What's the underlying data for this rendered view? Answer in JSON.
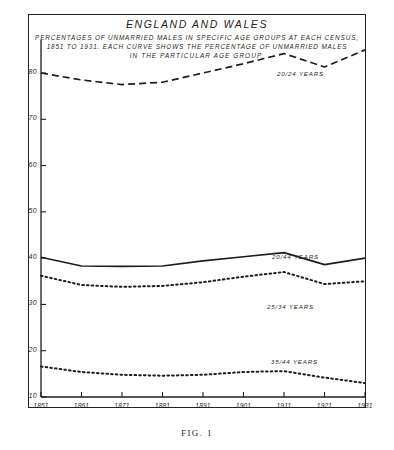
{
  "figure": {
    "caption": "FIG. 1",
    "title": "ENGLAND AND WALES",
    "subtitle_lines": [
      "PERCENTAGES OF UNMARRIED MALES IN SPECIFIC AGE GROUPS AT EACH CENSUS,",
      "1851 TO 1931. EACH CURVE SHOWS THE PERCENTAGE OF UNMARRIED MALES",
      "IN THE  PARTICULAR  AGE  GROUP."
    ]
  },
  "chart_data": {
    "type": "line",
    "title": "ENGLAND AND WALES",
    "subtitle": "PERCENTAGES OF UNMARRIED MALES IN SPECIFIC AGE GROUPS AT EACH CENSUS, 1851 TO 1931. EACH CURVE SHOWS THE PERCENTAGE OF UNMARRIED MALES IN THE PARTICULAR AGE GROUP.",
    "xlabel": "",
    "ylabel": "",
    "x": [
      1851,
      1861,
      1871,
      1881,
      1891,
      1901,
      1911,
      1921,
      1931
    ],
    "xtick_labels": [
      "1851",
      "1861",
      "1871",
      "1881",
      "1891",
      "1901",
      "1911",
      "1921",
      "1931"
    ],
    "ytick_labels": [
      "80",
      "70",
      "60",
      "50",
      "40",
      "30",
      "20",
      "10"
    ],
    "yticks": [
      80,
      70,
      60,
      50,
      40,
      30,
      20,
      10
    ],
    "ylim": [
      10,
      88
    ],
    "xlim": [
      1851,
      1931
    ],
    "grid": false,
    "legend": "inline-labels",
    "series": [
      {
        "name": "20/24 YEARS",
        "label": "20/24 YEARS",
        "style": "dashed",
        "values": [
          80.0,
          78.5,
          77.5,
          78.0,
          80.0,
          82.0,
          84.2,
          81.3,
          85.0
        ]
      },
      {
        "name": "20/44 YEARS",
        "label": "20/44 YEARS",
        "style": "solid",
        "values": [
          40.2,
          38.3,
          38.2,
          38.3,
          39.4,
          40.3,
          41.2,
          38.6,
          40.0
        ]
      },
      {
        "name": "25/34 YEARS",
        "label": "25/34 YEARS",
        "style": "dotted",
        "values": [
          36.2,
          34.2,
          33.8,
          34.0,
          34.8,
          36.0,
          37.0,
          34.4,
          35.0
        ]
      },
      {
        "name": "35/44 YEARS",
        "label": "35/44 YEARS",
        "style": "dotted",
        "values": [
          16.6,
          15.4,
          14.8,
          14.6,
          14.8,
          15.4,
          15.6,
          14.2,
          13.0
        ]
      }
    ]
  },
  "colors": {
    "ink": "#1d1d1d",
    "background": "#ffffff"
  }
}
